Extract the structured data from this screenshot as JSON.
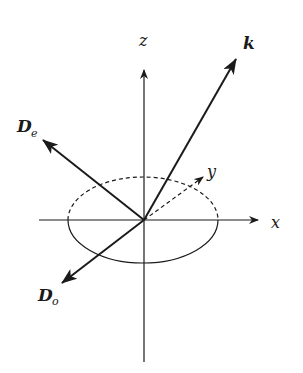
{
  "diagram": {
    "axes": {
      "x": {
        "label": "x"
      },
      "y": {
        "label": "y"
      },
      "z": {
        "label": "z"
      }
    },
    "vectors": {
      "k": {
        "label": "k"
      },
      "De": {
        "label": "D",
        "subscript": "e"
      },
      "Do": {
        "label": "D",
        "subscript": "o"
      }
    },
    "colors": {
      "stroke": "#1a1a1a",
      "background": "#ffffff"
    }
  }
}
